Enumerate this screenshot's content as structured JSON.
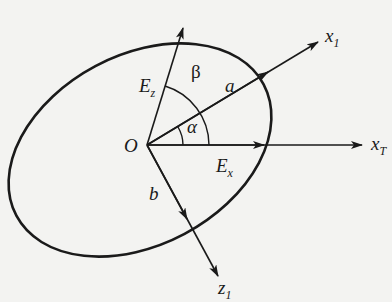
{
  "diagram": {
    "type": "polarization-ellipse",
    "colors": {
      "stroke": "#1a1a1a",
      "background": "#f3f3f1"
    },
    "labels": {
      "origin": "O",
      "ez_main": "E",
      "ez_sub": "z",
      "ex_main": "E",
      "ex_sub": "x",
      "beta": "β",
      "alpha": "α",
      "a": "a",
      "b": "b",
      "x1_main": "x",
      "x1_sub": "1",
      "xt_main": "x",
      "xt_sub": "T",
      "z1_main": "z",
      "z1_sub": "1"
    },
    "vectors": [
      {
        "name": "E_z",
        "from": "O",
        "direction": "up-right (steep)"
      },
      {
        "name": "a",
        "from": "O",
        "direction": "along x1 axis"
      },
      {
        "name": "E_x",
        "from": "O",
        "direction": "along x_T axis"
      },
      {
        "name": "b",
        "from": "O",
        "direction": "along z1 axis"
      }
    ],
    "angles": [
      {
        "name": "α",
        "between": [
          "x_T",
          "x1"
        ]
      },
      {
        "name": "β",
        "between": [
          "x1",
          "E_z"
        ]
      }
    ]
  }
}
